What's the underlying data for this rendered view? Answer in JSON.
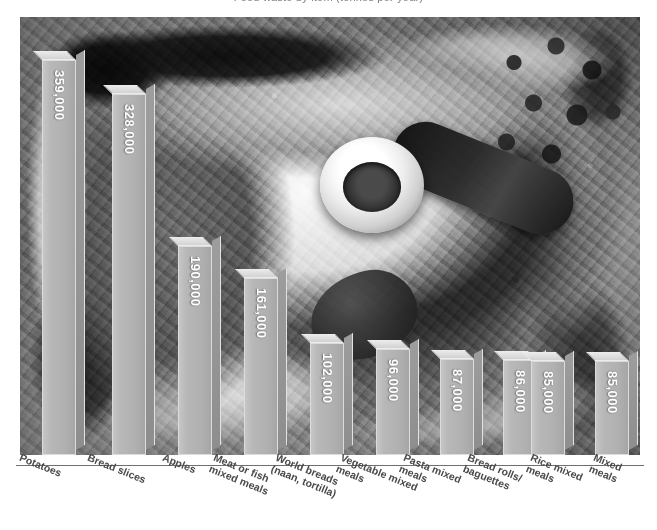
{
  "title_sliver": "Food waste by item (tonnes per year)",
  "chart_data": {
    "type": "bar",
    "title": "Food waste by item (tonnes per year)",
    "xlabel": "",
    "ylabel": "",
    "grid": false,
    "legend": null,
    "ylim": [
      0,
      380000
    ],
    "categories": [
      "Potatoes",
      "Bread slices",
      "Apples",
      "Meat or fish\nmixed meals",
      "World breads\n(naan, tortilla)",
      "Vegetable mixed\nmeals",
      "Pasta mixed\nmeals",
      "Bread rolls/\nbaguettes",
      "Rice mixed\nmeals",
      "Mixed meals"
    ],
    "values": [
      359000,
      328000,
      190000,
      161000,
      102000,
      96000,
      87000,
      86000,
      85000,
      85000
    ],
    "value_labels": [
      "359,000",
      "328,000",
      "190,000",
      "161,000",
      "102,000",
      "96,000",
      "87,000",
      "86,000",
      "85,000",
      "85,000"
    ]
  },
  "style": {
    "bar_face": "#b4b4b4",
    "bar_top": "#dcdcdc",
    "bar_side": "#949494",
    "value_text": "#ffffff",
    "label_text": "#4a4a4a",
    "axis_line": "#6f6f6f",
    "page_background": "#ffffff"
  },
  "background_image": {
    "description": "grayscale photograph of assorted food waste",
    "alt": "food-waste-photo"
  },
  "bars": [
    {
      "label": "Potatoes",
      "value_label": "359,000",
      "left": 20,
      "width": 36,
      "height": 345
    },
    {
      "label": "Bread slices",
      "value_label": "328,000",
      "left": 95,
      "width": 36,
      "height": 316
    },
    {
      "label": "Apples",
      "value_label": "190,000",
      "left": 163,
      "width": 36,
      "height": 183
    },
    {
      "label": "Meat or fish mixed meals",
      "value_label": "161,000",
      "left": 225,
      "width": 36,
      "height": 155
    },
    {
      "label": "World breads (naan, tortilla)",
      "value_label": "102,000",
      "left": 288,
      "width": 36,
      "height": 98
    },
    {
      "label": "Vegetable mixed meals",
      "value_label": "96,000",
      "left": 351,
      "width": 36,
      "height": 92
    },
    {
      "label": "Pasta mixed meals",
      "value_label": "87,000",
      "left": 414,
      "width": 36,
      "height": 84
    },
    {
      "label": "Bread rolls/ baguettes",
      "value_label": "86,000",
      "left": 477,
      "width": 36,
      "height": 83
    },
    {
      "label": "Rice mixed meals",
      "value_label": "85,000",
      "left": 497,
      "width": 36,
      "height": 82
    },
    {
      "label": "Mixed meals",
      "value_label": "85,000",
      "left": 560,
      "width": 36,
      "height": 82
    }
  ],
  "x_labels": [
    {
      "text": "Potatoes",
      "left": 22
    },
    {
      "text": "Bread slices",
      "left": 90
    },
    {
      "text": "Apples",
      "left": 165
    },
    {
      "text": "Meat or fish\nmixed meals",
      "left": 216
    },
    {
      "text": "World breads\n(naan, tortilla)",
      "left": 278
    },
    {
      "text": "Vegetable mixed\nmeals",
      "left": 343
    },
    {
      "text": "Pasta mixed\nmeals",
      "left": 406
    },
    {
      "text": "Bread rolls/\nbaguettes",
      "left": 470
    },
    {
      "text": "Rice mixed\nmeals",
      "left": 533
    },
    {
      "text": "Mixed meals",
      "left": 596
    }
  ]
}
